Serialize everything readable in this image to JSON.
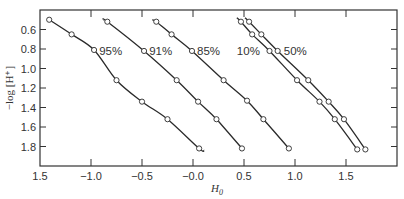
{
  "chart_data": {
    "type": "line",
    "title": "",
    "xlabel": "H0",
    "ylabel": "−log [H+]",
    "xlim": [
      -1.5,
      2.0
    ],
    "ylim": [
      2.0,
      0.4
    ],
    "y_inverted": true,
    "grid": false,
    "legend": "inline labels",
    "x_ticks": [
      -1.5,
      -1.0,
      -0.5,
      0.0,
      0.5,
      1.0,
      1.5
    ],
    "x_tick_labels": [
      "1.5",
      "−1.0",
      "−0.5",
      "−0.0",
      "0.5",
      "1.0",
      "1.5"
    ],
    "y_ticks": [
      0.6,
      0.8,
      1.0,
      1.2,
      1.4,
      1.6,
      1.8
    ],
    "y_tick_labels": [
      "0.6",
      "0.8",
      "1.0",
      "1.2",
      "1.4",
      "1.6",
      "1.8"
    ],
    "series": [
      {
        "name": "95%",
        "label_at": [
          -0.92,
          0.82
        ],
        "x": [
          -1.41,
          -1.19,
          -0.97,
          -0.75,
          -0.5,
          -0.25,
          0.06
        ],
        "y": [
          0.5,
          0.65,
          0.81,
          1.12,
          1.34,
          1.52,
          1.82
        ],
        "line_end": [
          0.11,
          1.84
        ]
      },
      {
        "name": "91%",
        "label_at": [
          -0.43,
          0.82
        ],
        "x": [
          -0.84,
          -0.48,
          -0.16,
          0.05,
          0.23,
          0.48
        ],
        "y": [
          0.52,
          0.82,
          1.12,
          1.34,
          1.52,
          1.82
        ],
        "line_start": [
          -0.88,
          0.5
        ]
      },
      {
        "name": "85%",
        "label_at": [
          0.04,
          0.82
        ],
        "x": [
          -0.36,
          -0.21,
          -0.01,
          0.3,
          0.53,
          0.69,
          0.94
        ],
        "y": [
          0.52,
          0.65,
          0.82,
          1.12,
          1.33,
          1.52,
          1.82
        ],
        "line_start": [
          -0.4,
          0.5
        ]
      },
      {
        "name": "10%",
        "label_at": [
          0.43,
          0.82
        ],
        "x": [
          0.47,
          0.58,
          0.75,
          1.02,
          1.24,
          1.39,
          1.61
        ],
        "y": [
          0.52,
          0.65,
          0.82,
          1.12,
          1.34,
          1.52,
          1.83
        ],
        "line_start": [
          0.43,
          0.48
        ]
      },
      {
        "name": "50%",
        "label_at": [
          0.89,
          0.82
        ],
        "x": [
          0.55,
          0.67,
          0.83,
          1.13,
          1.33,
          1.48,
          1.69
        ],
        "y": [
          0.52,
          0.65,
          0.82,
          1.12,
          1.34,
          1.52,
          1.83
        ],
        "line_start": [
          0.51,
          0.48
        ]
      }
    ]
  },
  "labels": {
    "ylabel": "−log [H⁺]",
    "xlabel_main": "H",
    "xlabel_sub": "0"
  }
}
